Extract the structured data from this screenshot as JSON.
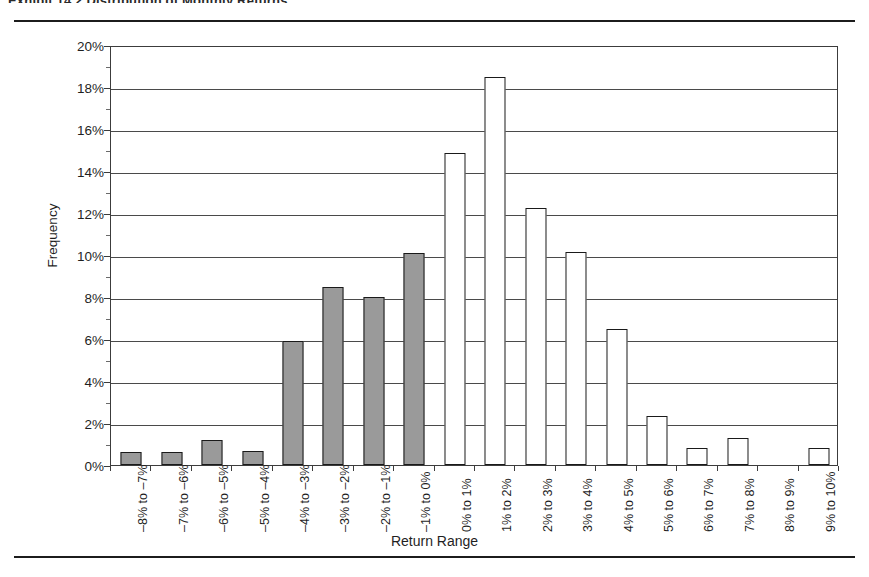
{
  "document": {
    "exhibit_title": "Exhibit 14.2   Distribution of Monthly Returns",
    "rule_top": "horizontal-rule",
    "rule_bottom": "horizontal-rule"
  },
  "chart_data": {
    "type": "bar",
    "title": "",
    "xlabel": "Return Range",
    "ylabel": "Frequency",
    "ylim": [
      0,
      20
    ],
    "ytick_labels": [
      "0%",
      "2%",
      "4%",
      "6%",
      "8%",
      "10%",
      "12%",
      "14%",
      "16%",
      "18%",
      "20%"
    ],
    "ytick_values": [
      0,
      2,
      4,
      6,
      8,
      10,
      12,
      14,
      16,
      18,
      20
    ],
    "grid": true,
    "legend": "none",
    "categories": [
      "–8% to –7%",
      "–7% to –6%",
      "–6% to –5%",
      "–5% to –4%",
      "–4% to –3%",
      "–3% to –2%",
      "–2% to –1%",
      "–1% to 0%",
      "0% to 1%",
      "1% to 2%",
      "2% to 3%",
      "3% to 4%",
      "4% to 5%",
      "5% to 6%",
      "6% to 7%",
      "7% to 8%",
      "8% to 9%",
      "9% to 10%"
    ],
    "values": [
      0.6,
      0.6,
      1.2,
      0.65,
      5.9,
      8.5,
      8.0,
      10.1,
      14.85,
      18.5,
      12.25,
      10.15,
      6.5,
      2.35,
      0.8,
      1.3,
      0.0,
      0.8
    ],
    "value_labels": [
      "0.6%",
      "0.6%",
      "1.2%",
      "0.65%",
      "5.9%",
      "8.5%",
      "8.0%",
      "10.1%",
      "14.85%",
      "18.5%",
      "12.25%",
      "10.15%",
      "6.5%",
      "2.35%",
      "0.8%",
      "1.3%",
      "0%",
      "0.8%"
    ],
    "bar_fill": [
      "#9a9a9a",
      "#9a9a9a",
      "#9a9a9a",
      "#9a9a9a",
      "#9a9a9a",
      "#9a9a9a",
      "#9a9a9a",
      "#9a9a9a",
      "#ffffff",
      "#ffffff",
      "#ffffff",
      "#ffffff",
      "#ffffff",
      "#ffffff",
      "#ffffff",
      "#ffffff",
      "#ffffff",
      "#ffffff"
    ],
    "colors": {
      "negative_fill": "#9a9a9a",
      "positive_fill": "#ffffff",
      "bar_outline": "#1a1a1a",
      "gridline": "#4a4a4a",
      "frame": "#3c3c3c",
      "text": "#1f1f1f",
      "background": "#ffffff"
    }
  }
}
